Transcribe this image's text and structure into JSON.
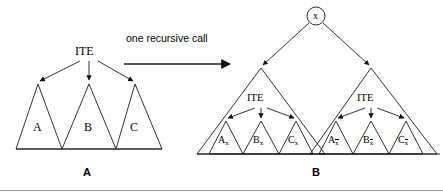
{
  "figure": {
    "background": "#ffffff",
    "stroke_color": "#1a1a1a",
    "rule_color": "#888888"
  },
  "transition": {
    "text": "one recursive call",
    "arrow": "right-arrow"
  },
  "left_panel": {
    "caption": "A",
    "root_label": "ITE",
    "children": [
      {
        "label": "A"
      },
      {
        "label": "B"
      },
      {
        "label": "C"
      }
    ]
  },
  "right_panel": {
    "caption": "B",
    "root_node": "x",
    "subtrees": [
      {
        "name": "positive-cofactor",
        "root_label": "ITE",
        "children": [
          {
            "base": "A",
            "sub": "x",
            "overline": false
          },
          {
            "base": "B",
            "sub": "x",
            "overline": false
          },
          {
            "base": "C",
            "sub": "x",
            "overline": false
          }
        ]
      },
      {
        "name": "negative-cofactor",
        "root_label": "ITE",
        "children": [
          {
            "base": "A",
            "sub": "x",
            "overline": true
          },
          {
            "base": "B",
            "sub": "x",
            "overline": true
          },
          {
            "base": "C",
            "sub": "x",
            "overline": true
          }
        ]
      }
    ]
  }
}
